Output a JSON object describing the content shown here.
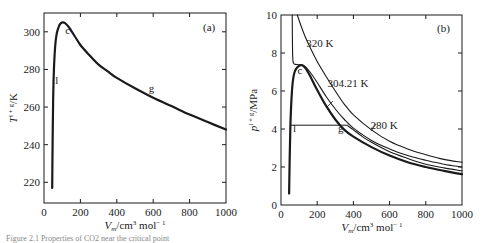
{
  "caption": "Figure 2.1  Properties of CO2 near the critical point",
  "chart_data": [
    {
      "type": "line",
      "panel_tag": "(a)",
      "title": "",
      "xlabel": "V_m/cm^3 mol^-1",
      "xlabel_main": "V",
      "xlabel_sub": "m",
      "xlabel_rest": "/cm",
      "xlabel_sup": "3",
      "xlabel_unit": " mol",
      "xlabel_unit_sup": "− 1",
      "ylabel": "T^{l+g}/K",
      "ylabel_main": "T",
      "ylabel_sup": "l + g",
      "ylabel_rest": "/K",
      "xlim": [
        0,
        1000
      ],
      "ylim": [
        209,
        310
      ],
      "xticks": [
        0,
        200,
        400,
        600,
        800,
        1000
      ],
      "xtick_labels": [
        "0",
        "200",
        "400",
        "600",
        "800",
        "1000"
      ],
      "yticks": [
        220,
        240,
        260,
        280,
        300
      ],
      "ytick_labels": [
        "220",
        "240",
        "260",
        "280",
        "300"
      ],
      "grid": false,
      "series": [
        {
          "name": "coexistence curve",
          "x": [
            45,
            47,
            50,
            55,
            62,
            70,
            80,
            92,
            105,
            120,
            140,
            170,
            200,
            250,
            300,
            350,
            400,
            500,
            600,
            700,
            800,
            900,
            1000
          ],
          "y": [
            217,
            240,
            262,
            281,
            293,
            299,
            302.5,
            304.5,
            305,
            304.3,
            302,
            297.5,
            293,
            287.5,
            282.5,
            279,
            275.5,
            270,
            265,
            260.5,
            256,
            252,
            248
          ]
        }
      ],
      "annotations": [
        {
          "text": "c",
          "x": 130,
          "y": 299
        },
        {
          "text": "l",
          "x": 70,
          "y": 272
        },
        {
          "text": "g",
          "x": 590,
          "y": 268
        }
      ]
    },
    {
      "type": "line",
      "panel_tag": "(b)",
      "title": "",
      "xlabel": "V_m/cm^3 mol^-1",
      "xlabel_main": "V",
      "xlabel_sub": "m",
      "xlabel_rest": "/cm",
      "xlabel_sup": "3",
      "xlabel_unit": " mol",
      "xlabel_unit_sup": "− 1",
      "ylabel": "p^{l+g}/MPa",
      "ylabel_main": "p",
      "ylabel_sup": "l + g",
      "ylabel_rest": "/MPa",
      "xlim": [
        0,
        1000
      ],
      "ylim": [
        0,
        10
      ],
      "xticks": [
        0,
        200,
        400,
        600,
        800,
        1000
      ],
      "xtick_labels": [
        "0",
        "200",
        "400",
        "600",
        "800",
        "1000"
      ],
      "yticks": [
        0,
        2,
        4,
        6,
        8,
        10
      ],
      "ytick_labels": [
        "0",
        "2",
        "4",
        "6",
        "8",
        "10"
      ],
      "grid": false,
      "series": [
        {
          "name": "320 K",
          "x": [
            90,
            110,
            130,
            160,
            200,
            250,
            300,
            350,
            400,
            500,
            600,
            700,
            800,
            900,
            1000
          ],
          "y": [
            10,
            9.45,
            8.95,
            8.3,
            7.55,
            6.75,
            6.0,
            5.3,
            4.75,
            3.95,
            3.35,
            2.95,
            2.65,
            2.4,
            2.25
          ]
        },
        {
          "name": "304.21 K",
          "x": [
            62,
            63,
            64,
            66,
            70,
            80,
            100,
            130,
            160,
            200,
            250,
            300,
            350,
            400,
            500,
            600,
            700,
            800,
            900,
            1000
          ],
          "y": [
            10,
            8.8,
            8.0,
            7.6,
            7.45,
            7.4,
            7.38,
            7.3,
            7.0,
            6.45,
            5.7,
            5.05,
            4.5,
            4.05,
            3.4,
            2.95,
            2.6,
            2.35,
            2.15,
            2.0
          ]
        },
        {
          "name": "280 K",
          "x": [
            370,
            400,
            450,
            500,
            600,
            700,
            800,
            900,
            1000
          ],
          "y": [
            4.16,
            3.95,
            3.6,
            3.3,
            2.8,
            2.45,
            2.15,
            1.95,
            1.8
          ]
        },
        {
          "name": "coexistence curve",
          "x": [
            45,
            48,
            52,
            58,
            65,
            75,
            90,
            105,
            118,
            135,
            160,
            200,
            250,
            300,
            350,
            400,
            500,
            600,
            700,
            800,
            900,
            1000
          ],
          "y": [
            0.6,
            2.5,
            4.2,
            5.6,
            6.5,
            7.0,
            7.25,
            7.35,
            7.35,
            7.2,
            6.8,
            6.05,
            5.2,
            4.5,
            3.95,
            3.6,
            3.05,
            2.6,
            2.25,
            2.0,
            1.8,
            1.62
          ]
        },
        {
          "name": "tie line (280 K)",
          "x": [
            55,
            370
          ],
          "y": [
            4.2,
            4.2
          ]
        }
      ],
      "annotations": [
        {
          "text": "320 K",
          "x": 215,
          "y": 8.3
        },
        {
          "text": "304.21 K",
          "x": 370,
          "y": 6.2
        },
        {
          "text": "280 K",
          "x": 570,
          "y": 4.0
        },
        {
          "text": "c",
          "x": 105,
          "y": 6.9
        },
        {
          "text": "l",
          "x": 75,
          "y": 3.85
        },
        {
          "text": "g",
          "x": 330,
          "y": 3.85
        }
      ]
    }
  ]
}
